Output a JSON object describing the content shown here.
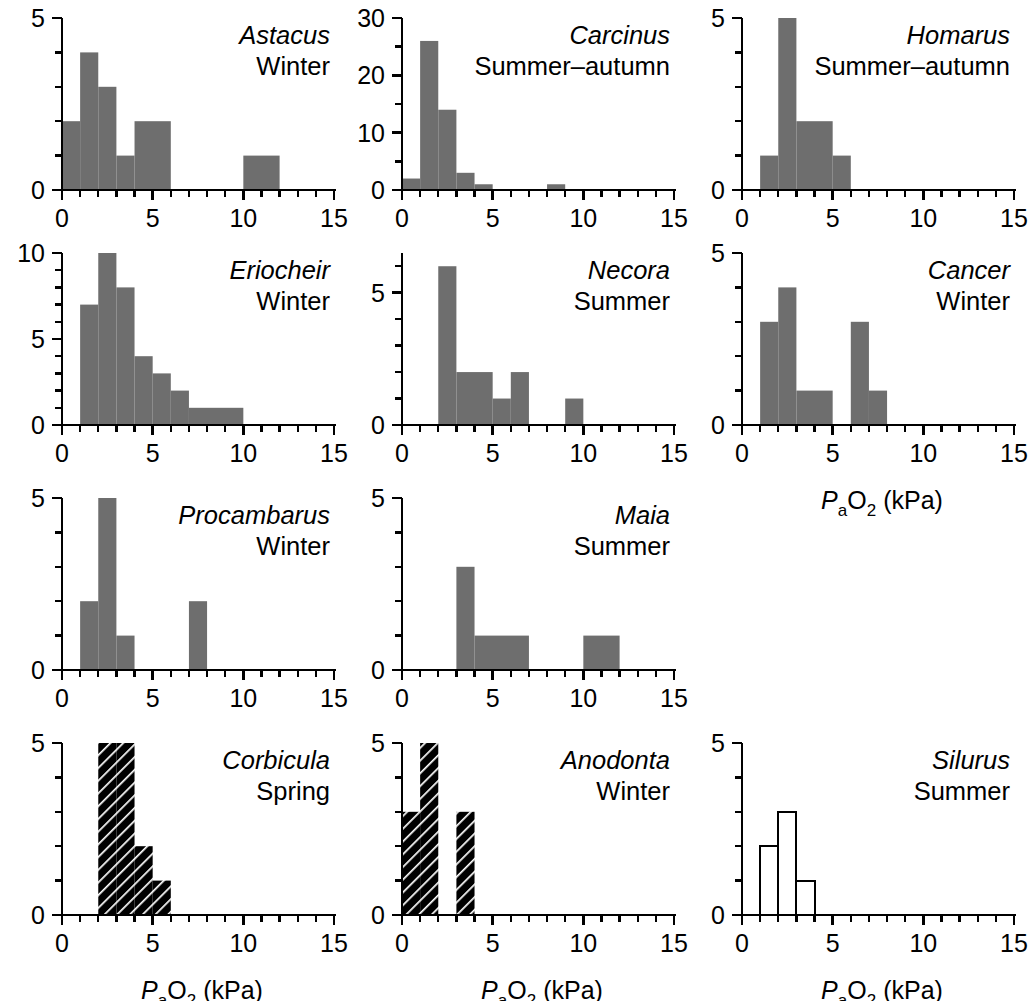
{
  "figure": {
    "axis_label": {
      "symbol_p": "P",
      "symbol_sub_a": "a",
      "symbol_o": "O",
      "symbol_sub_2": "2",
      "units": "(kPa)",
      "full": "PaO2 (kPa)"
    },
    "fill_color_solid": "#6e6e6e",
    "hatch_color": "#000000",
    "open_color": "#ffffff",
    "axis_color": "#000000"
  },
  "chart_data": [
    {
      "type": "bar",
      "panel_index": 0,
      "title": "Astacus",
      "subtitle": "Winter",
      "style": "solid",
      "xlabel": "PaO2 (kPa)",
      "ylabel": "",
      "xlim": [
        0,
        15
      ],
      "ylim": [
        0,
        5
      ],
      "xticks": [
        0,
        5,
        10,
        15
      ],
      "yticks": [
        0,
        5
      ],
      "x_minor_step": 1,
      "y_minor_step": 1,
      "grid": false,
      "bins": [
        {
          "start": 0,
          "end": 1,
          "value": 2
        },
        {
          "start": 1,
          "end": 2,
          "value": 4
        },
        {
          "start": 2,
          "end": 3,
          "value": 3
        },
        {
          "start": 3,
          "end": 4,
          "value": 1
        },
        {
          "start": 4,
          "end": 6,
          "value": 2
        },
        {
          "start": 10,
          "end": 12,
          "value": 1
        }
      ]
    },
    {
      "type": "bar",
      "panel_index": 1,
      "title": "Carcinus",
      "subtitle": "Summer–autumn",
      "style": "solid",
      "xlabel": "PaO2 (kPa)",
      "ylabel": "",
      "xlim": [
        0,
        15
      ],
      "ylim": [
        0,
        30
      ],
      "xticks": [
        0,
        5,
        10,
        15
      ],
      "yticks": [
        0,
        10,
        20,
        30
      ],
      "x_minor_step": 1,
      "y_minor_step": 5,
      "grid": false,
      "bins": [
        {
          "start": 0,
          "end": 1,
          "value": 2
        },
        {
          "start": 1,
          "end": 2,
          "value": 26
        },
        {
          "start": 2,
          "end": 3,
          "value": 14
        },
        {
          "start": 3,
          "end": 4,
          "value": 3
        },
        {
          "start": 4,
          "end": 5,
          "value": 1
        },
        {
          "start": 8,
          "end": 9,
          "value": 1
        }
      ]
    },
    {
      "type": "bar",
      "panel_index": 2,
      "title": "Homarus",
      "subtitle": "Summer–autumn",
      "style": "solid",
      "xlabel": "PaO2 (kPa)",
      "ylabel": "",
      "xlim": [
        0,
        15
      ],
      "ylim": [
        0,
        5
      ],
      "xticks": [
        0,
        5,
        10,
        15
      ],
      "yticks": [
        0,
        5
      ],
      "x_minor_step": 1,
      "y_minor_step": 1,
      "grid": false,
      "bins": [
        {
          "start": 1,
          "end": 2,
          "value": 1
        },
        {
          "start": 2,
          "end": 3,
          "value": 5
        },
        {
          "start": 3,
          "end": 5,
          "value": 2
        },
        {
          "start": 5,
          "end": 6,
          "value": 1
        }
      ]
    },
    {
      "type": "bar",
      "panel_index": 3,
      "title": "Eriocheir",
      "subtitle": "Winter",
      "style": "solid",
      "xlabel": "PaO2 (kPa)",
      "ylabel": "",
      "xlim": [
        0,
        15
      ],
      "ylim": [
        0,
        10
      ],
      "xticks": [
        0,
        5,
        10,
        15
      ],
      "yticks": [
        0,
        5,
        10
      ],
      "x_minor_step": 1,
      "y_minor_step": 1,
      "grid": false,
      "bins": [
        {
          "start": 1,
          "end": 2,
          "value": 7
        },
        {
          "start": 2,
          "end": 3,
          "value": 10
        },
        {
          "start": 3,
          "end": 4,
          "value": 8
        },
        {
          "start": 4,
          "end": 5,
          "value": 4
        },
        {
          "start": 5,
          "end": 6,
          "value": 3
        },
        {
          "start": 6,
          "end": 7,
          "value": 2
        },
        {
          "start": 7,
          "end": 10,
          "value": 1
        }
      ]
    },
    {
      "type": "bar",
      "panel_index": 4,
      "title": "Necora",
      "subtitle": "Summer",
      "style": "solid",
      "xlabel": "PaO2 (kPa)",
      "ylabel": "",
      "xlim": [
        0,
        15
      ],
      "ylim": [
        0,
        6.5
      ],
      "xticks": [
        0,
        5,
        10,
        15
      ],
      "yticks": [
        0,
        5
      ],
      "x_minor_step": 1,
      "y_minor_step": 1,
      "grid": false,
      "bins": [
        {
          "start": 2,
          "end": 3,
          "value": 6
        },
        {
          "start": 3,
          "end": 5,
          "value": 2
        },
        {
          "start": 5,
          "end": 6,
          "value": 1
        },
        {
          "start": 6,
          "end": 7,
          "value": 2
        },
        {
          "start": 9,
          "end": 10,
          "value": 1
        }
      ]
    },
    {
      "type": "bar",
      "panel_index": 5,
      "title": "Cancer",
      "subtitle": "Winter",
      "style": "solid",
      "xlabel": "PaO2 (kPa)",
      "ylabel": "",
      "xlim": [
        0,
        15
      ],
      "ylim": [
        0,
        5
      ],
      "xticks": [
        0,
        5,
        10,
        15
      ],
      "yticks": [
        0,
        5
      ],
      "x_minor_step": 1,
      "y_minor_step": 1,
      "grid": false,
      "show_xlabel": true,
      "bins": [
        {
          "start": 1,
          "end": 2,
          "value": 3
        },
        {
          "start": 2,
          "end": 3,
          "value": 4
        },
        {
          "start": 3,
          "end": 5,
          "value": 1
        },
        {
          "start": 6,
          "end": 7,
          "value": 3
        },
        {
          "start": 7,
          "end": 8,
          "value": 1
        }
      ]
    },
    {
      "type": "bar",
      "panel_index": 6,
      "title": "Procambarus",
      "subtitle": "Winter",
      "style": "solid",
      "xlabel": "PaO2 (kPa)",
      "ylabel": "",
      "xlim": [
        0,
        15
      ],
      "ylim": [
        0,
        5
      ],
      "xticks": [
        0,
        5,
        10,
        15
      ],
      "yticks": [
        0,
        5
      ],
      "x_minor_step": 1,
      "y_minor_step": 1,
      "grid": false,
      "bins": [
        {
          "start": 1,
          "end": 2,
          "value": 2
        },
        {
          "start": 2,
          "end": 3,
          "value": 5
        },
        {
          "start": 3,
          "end": 4,
          "value": 1
        },
        {
          "start": 7,
          "end": 8,
          "value": 2
        }
      ]
    },
    {
      "type": "bar",
      "panel_index": 7,
      "title": "Maia",
      "subtitle": "Summer",
      "style": "solid",
      "xlabel": "PaO2 (kPa)",
      "ylabel": "",
      "xlim": [
        0,
        15
      ],
      "ylim": [
        0,
        5
      ],
      "xticks": [
        0,
        5,
        10,
        15
      ],
      "yticks": [
        0,
        5
      ],
      "x_minor_step": 1,
      "y_minor_step": 1,
      "grid": false,
      "bins": [
        {
          "start": 3,
          "end": 4,
          "value": 3
        },
        {
          "start": 4,
          "end": 7,
          "value": 1
        },
        {
          "start": 10,
          "end": 12,
          "value": 1
        }
      ]
    },
    {
      "type": "bar",
      "panel_index": 8,
      "title": "Corbicula",
      "subtitle": "Spring",
      "style": "hatched",
      "xlabel": "PaO2 (kPa)",
      "ylabel": "",
      "xlim": [
        0,
        15
      ],
      "ylim": [
        0,
        5
      ],
      "xticks": [
        0,
        5,
        10,
        15
      ],
      "yticks": [
        0,
        5
      ],
      "x_minor_step": 1,
      "y_minor_step": 1,
      "grid": false,
      "show_xlabel": true,
      "bins": [
        {
          "start": 2,
          "end": 3,
          "value": 5
        },
        {
          "start": 3,
          "end": 4,
          "value": 5
        },
        {
          "start": 4,
          "end": 5,
          "value": 2
        },
        {
          "start": 5,
          "end": 6,
          "value": 1
        }
      ]
    },
    {
      "type": "bar",
      "panel_index": 9,
      "title": "Anodonta",
      "subtitle": "Winter",
      "style": "hatched",
      "xlabel": "PaO2 (kPa)",
      "ylabel": "",
      "xlim": [
        0,
        15
      ],
      "ylim": [
        0,
        5
      ],
      "xticks": [
        0,
        5,
        10,
        15
      ],
      "yticks": [
        0,
        5
      ],
      "x_minor_step": 1,
      "y_minor_step": 1,
      "grid": false,
      "show_xlabel": true,
      "bins": [
        {
          "start": 0,
          "end": 1,
          "value": 3
        },
        {
          "start": 1,
          "end": 2,
          "value": 5
        },
        {
          "start": 3,
          "end": 4,
          "value": 3
        }
      ]
    },
    {
      "type": "bar",
      "panel_index": 10,
      "title": "Silurus",
      "subtitle": "Summer",
      "style": "open",
      "xlabel": "PaO2 (kPa)",
      "ylabel": "",
      "xlim": [
        0,
        15
      ],
      "ylim": [
        0,
        5
      ],
      "xticks": [
        0,
        5,
        10,
        15
      ],
      "yticks": [
        0,
        5
      ],
      "x_minor_step": 1,
      "y_minor_step": 1,
      "grid": false,
      "show_xlabel": true,
      "bins": [
        {
          "start": 1,
          "end": 2,
          "value": 2
        },
        {
          "start": 2,
          "end": 3,
          "value": 3
        },
        {
          "start": 3,
          "end": 4,
          "value": 1
        }
      ]
    }
  ]
}
